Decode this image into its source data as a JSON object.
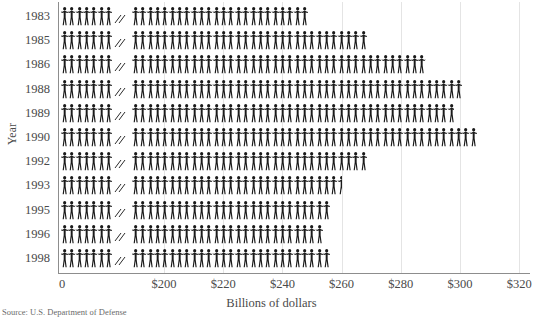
{
  "chart_data": {
    "type": "bar",
    "title": "",
    "xlabel": "Billions of dollars",
    "ylabel": "Year",
    "categories": [
      "1983",
      "1985",
      "1986",
      "1988",
      "1989",
      "1990",
      "1992",
      "1993",
      "1995",
      "1996",
      "1998"
    ],
    "values": [
      249,
      269,
      289,
      302,
      298,
      306,
      269,
      260,
      256,
      254,
      257
    ],
    "xlim": [
      0,
      320
    ],
    "axis_break": true,
    "axis_break_between": [
      0,
      200
    ],
    "xticks": [
      0,
      200,
      220,
      240,
      260,
      280,
      300,
      320
    ],
    "xticklabels": [
      "0",
      "$200",
      "$220",
      "$240",
      "$260",
      "$280",
      "$300",
      "$320"
    ],
    "grid": "vertical",
    "legend": "none",
    "glyph": "person-icon",
    "glyph_unit_value": 2,
    "note": "Pictogram bar chart; each bar is drawn as a row of human figures."
  },
  "axis": {
    "y_title": "Year",
    "x_title": "Billions of dollars"
  },
  "source": {
    "text": "Source: U.S. Department of Defense"
  },
  "colors": {
    "figure": "#1a1a1a",
    "gridline": "#e4e4e4",
    "axis": "#8d8d8d",
    "text": "#4a4a4a",
    "background": "#ffffff"
  }
}
